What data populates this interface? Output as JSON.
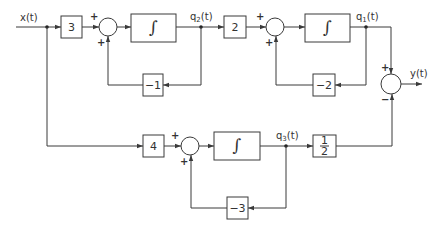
{
  "diagram": {
    "type": "block-diagram",
    "signals": {
      "input": "x(t)",
      "output": "y(t)",
      "q1": "q",
      "q1_sub": "1",
      "q1_tail": "(t)",
      "q2": "q",
      "q2_sub": "2",
      "q2_tail": "(t)",
      "q3": "q",
      "q3_sub": "3",
      "q3_tail": "(t)"
    },
    "gains": {
      "g3": "3",
      "g2": "2",
      "g4": "4",
      "fb1": "−1",
      "fb2": "−2",
      "fb3": "−3",
      "half_num": "1",
      "half_den": "2"
    },
    "integrator_symbol": "∫",
    "signs": {
      "plus": "+",
      "minus": "−"
    }
  }
}
